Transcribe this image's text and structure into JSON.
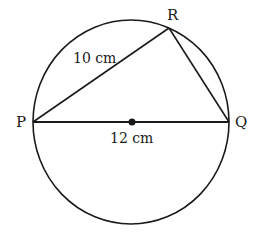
{
  "diagram": {
    "colors": {
      "stroke": "#1a1a1a",
      "background": "#ffffff"
    },
    "circle": {
      "cx": 131,
      "cy": 122,
      "rx": 98,
      "ry": 102
    },
    "center_point": {
      "x": 132,
      "y": 122
    },
    "vertices": {
      "P": {
        "label": "P",
        "x": 33,
        "y": 122,
        "label_x": 22,
        "label_y": 127
      },
      "Q": {
        "label": "Q",
        "x": 229,
        "y": 122,
        "label_x": 242,
        "label_y": 127
      },
      "R": {
        "label": "R",
        "x": 169,
        "y": 28,
        "label_x": 173,
        "label_y": 19
      }
    },
    "edges": [
      {
        "from": "P",
        "to": "R",
        "length_label": "10 cm"
      },
      {
        "from": "R",
        "to": "Q",
        "length_label": ""
      },
      {
        "from": "P",
        "to": "Q",
        "length_label": "12 cm"
      }
    ],
    "measurements": {
      "pr": "10 cm",
      "pq": "12 cm"
    }
  }
}
